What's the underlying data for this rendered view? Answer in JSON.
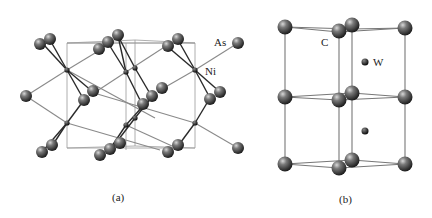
{
  "figure": {
    "panels": [
      {
        "id": "a",
        "caption": "(a)",
        "structure": "NiAs",
        "atom_labels": [
          {
            "text": "As",
            "x": 214,
            "y": 46
          },
          {
            "text": "Ni",
            "x": 205,
            "y": 75
          }
        ]
      },
      {
        "id": "b",
        "caption": "(b)",
        "structure": "WC",
        "atom_labels": [
          {
            "text": "C",
            "x": 321,
            "y": 46
          },
          {
            "text": "W",
            "x": 373,
            "y": 66
          }
        ]
      }
    ]
  }
}
